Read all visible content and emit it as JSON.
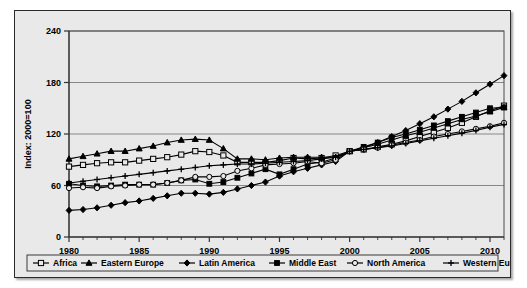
{
  "chart_data": {
    "type": "line",
    "title": "",
    "xlabel": "",
    "ylabel": "Index: 2000=100",
    "ylim": [
      0,
      240
    ],
    "xlim": [
      1980,
      2011
    ],
    "yticks": [
      0,
      60,
      120,
      180,
      240
    ],
    "xticks": [
      1980,
      1985,
      1990,
      1995,
      2000,
      2005,
      2010
    ],
    "xtick_labels": [
      "1980",
      "1985",
      "1990",
      "1995",
      "2000",
      "2005",
      "2010"
    ],
    "ytick_labels": [
      "0",
      "60",
      "120",
      "180",
      "240"
    ],
    "grid": "horizontal",
    "legend_position": "bottom",
    "x": [
      1980,
      1981,
      1982,
      1983,
      1984,
      1985,
      1986,
      1987,
      1988,
      1989,
      1990,
      1991,
      1992,
      1993,
      1994,
      1995,
      1996,
      1997,
      1998,
      1999,
      2000,
      2001,
      2002,
      2003,
      2004,
      2005,
      2006,
      2007,
      2008,
      2009,
      2010,
      2011
    ],
    "series": [
      {
        "name": "Africa",
        "marker": "open-square",
        "values": [
          82,
          84,
          86,
          87,
          87,
          89,
          91,
          93,
          96,
          100,
          99,
          95,
          87,
          87,
          87,
          89,
          92,
          91,
          92,
          95,
          100,
          102,
          105,
          108,
          112,
          117,
          122,
          127,
          133,
          140,
          147,
          153
        ]
      },
      {
        "name": "Eastern Europe",
        "marker": "filled-triangle",
        "values": [
          91,
          94,
          97,
          100,
          100,
          103,
          106,
          110,
          113,
          114,
          113,
          103,
          91,
          91,
          90,
          92,
          93,
          93,
          93,
          93,
          100,
          104,
          108,
          113,
          118,
          122,
          127,
          132,
          137,
          141,
          146,
          151
        ]
      },
      {
        "name": "Latin America",
        "marker": "filled-diamond",
        "values": [
          31,
          32,
          34,
          37,
          40,
          42,
          45,
          48,
          51,
          51,
          50,
          52,
          56,
          60,
          64,
          71,
          76,
          80,
          84,
          88,
          100,
          104,
          110,
          117,
          124,
          132,
          140,
          149,
          158,
          168,
          178,
          188
        ]
      },
      {
        "name": "Middle East",
        "marker": "filled-square",
        "values": [
          62,
          60,
          59,
          60,
          61,
          61,
          61,
          63,
          66,
          67,
          62,
          64,
          69,
          74,
          79,
          73,
          79,
          85,
          87,
          92,
          100,
          105,
          110,
          116,
          120,
          125,
          130,
          135,
          140,
          145,
          150,
          151
        ]
      },
      {
        "name": "North America",
        "marker": "open-circle",
        "values": [
          57,
          58,
          57,
          59,
          60,
          61,
          61,
          63,
          66,
          70,
          70,
          71,
          77,
          80,
          84,
          85,
          86,
          88,
          86,
          90,
          100,
          102,
          104,
          107,
          110,
          113,
          117,
          120,
          123,
          126,
          129,
          133
        ]
      },
      {
        "name": "Western Europe",
        "marker": "plus",
        "values": [
          63,
          65,
          67,
          69,
          71,
          73,
          75,
          77,
          79,
          81,
          83,
          84,
          85,
          85,
          86,
          87,
          88,
          89,
          91,
          93,
          100,
          102,
          104,
          106,
          109,
          112,
          115,
          118,
          121,
          124,
          128,
          131
        ]
      }
    ]
  }
}
